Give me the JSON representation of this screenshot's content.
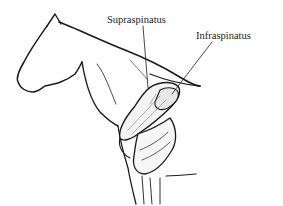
{
  "diagram": {
    "labels": [
      {
        "text": "Supraspinatus"
      },
      {
        "text": "Infraspinatus"
      }
    ]
  }
}
